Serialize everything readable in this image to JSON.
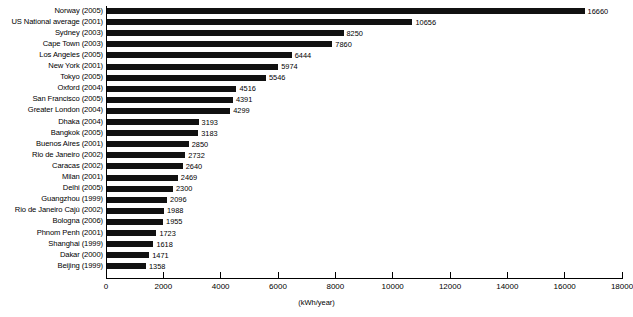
{
  "chart_data": {
    "type": "bar",
    "orientation": "horizontal",
    "title": "",
    "xlabel": "(kWh/year)",
    "ylabel": "",
    "xlim": [
      0,
      18000
    ],
    "xticks": [
      0,
      2000,
      4000,
      6000,
      8000,
      10000,
      12000,
      14000,
      16000,
      18000
    ],
    "xtick_labels": [
      "0",
      "2000",
      "4000",
      "6000",
      "8000",
      "10000",
      "12000",
      "14000",
      "16000",
      "18000"
    ],
    "grid": false,
    "legend": false,
    "bar_color": "#111111",
    "data_labels": true,
    "categories": [
      "Norway (2005)",
      "US National average (2001)",
      "Sydney (2003)",
      "Cape Town (2003)",
      "Los Angeles (2005)",
      "New York (2001)",
      "Tokyo (2005)",
      "Oxford (2004)",
      "San Francisco (2005)",
      "Greater London (2004)",
      "Dhaka (2004)",
      "Bangkok (2005)",
      "Buenos Aires (2001)",
      "Rio de Janeiro (2002)",
      "Caracas (2002)",
      "Milan (2001)",
      "Delhi (2005)",
      "Guangzhou (1999)",
      "Rio de Janeiro Cajú (2002)",
      "Bologna (2006)",
      "Phnom Penh (2001)",
      "Shanghai (1999)",
      "Dakar (2000)",
      "Beijing (1999)"
    ],
    "values": [
      16660,
      10656,
      8250,
      7860,
      6444,
      5974,
      5546,
      4516,
      4391,
      4299,
      3193,
      3183,
      2850,
      2732,
      2640,
      2469,
      2300,
      2096,
      1988,
      1955,
      1723,
      1618,
      1471,
      1358
    ],
    "value_labels": [
      "16660",
      "10656",
      "8250",
      "7860",
      "6444",
      "5974",
      "5546",
      "4516",
      "4391",
      "4299",
      "3193",
      "3183",
      "2850",
      "2732",
      "2640",
      "2469",
      "2300",
      "2096",
      "1988",
      "1955",
      "1723",
      "1618",
      "1471",
      "1358"
    ]
  }
}
